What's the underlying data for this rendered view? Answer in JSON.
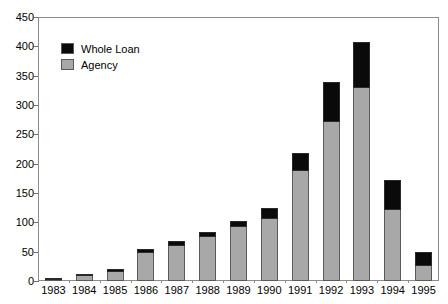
{
  "chart_data": {
    "type": "bar",
    "title": "",
    "subtitle": "",
    "xlabel": "",
    "ylabel": "",
    "stacked": true,
    "grid": false,
    "legend_position": "top-left",
    "ylim": [
      0,
      450
    ],
    "ytick_step": 50,
    "ytick_labels": [
      "450",
      "400",
      "350",
      "300",
      "250",
      "200",
      "150",
      "100",
      "50",
      "0"
    ],
    "ytick_values": [
      450,
      400,
      350,
      300,
      250,
      200,
      150,
      100,
      50,
      0
    ],
    "categories": [
      "1983",
      "1984",
      "1985",
      "1986",
      "1987",
      "1988",
      "1989",
      "1990",
      "1991",
      "1992",
      "1993",
      "1994",
      "1995"
    ],
    "series": [
      {
        "name": "Agency",
        "color": "#a8a8a8",
        "values": [
          4,
          10,
          17,
          50,
          62,
          76,
          94,
          108,
          190,
          272,
          330,
          122,
          28
        ]
      },
      {
        "name": "Whole Loan",
        "color": "#0a0a0a",
        "values": [
          1,
          2,
          3,
          4,
          7,
          7,
          9,
          17,
          28,
          68,
          77,
          50,
          21
        ]
      }
    ],
    "totals": [
      5,
      12,
      20,
      54,
      69,
      83,
      103,
      125,
      218,
      340,
      407,
      172,
      49
    ]
  },
  "legend": {
    "items": [
      {
        "label": "Whole Loan",
        "swatch": "#0a0a0a"
      },
      {
        "label": "Agency",
        "swatch": "#a8a8a8"
      }
    ]
  }
}
